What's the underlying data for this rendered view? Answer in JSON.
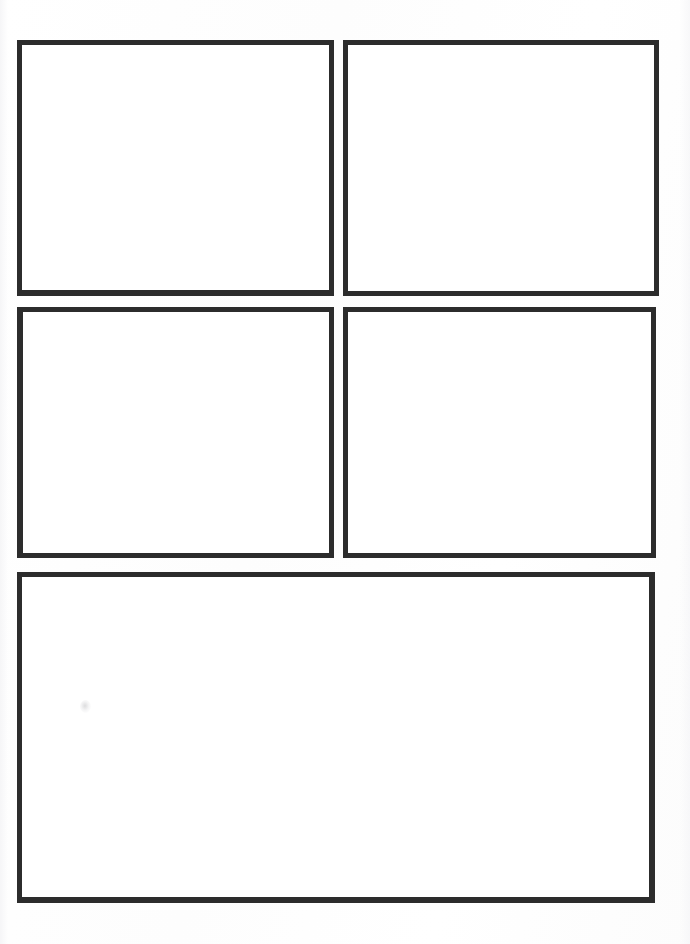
{
  "page": {
    "width": 690,
    "height": 944,
    "background_color": "#fefefe",
    "border_color": "#2c2c2c",
    "panel_fill_color": "#ffffff"
  },
  "panels": [
    {
      "id": "panel-1",
      "position": "top-left",
      "row": 1,
      "column": 1,
      "content": "",
      "x": 17,
      "y": 40,
      "width": 317,
      "height": 256
    },
    {
      "id": "panel-2",
      "position": "top-right",
      "row": 1,
      "column": 2,
      "content": "",
      "x": 343,
      "y": 40,
      "width": 316,
      "height": 256
    },
    {
      "id": "panel-3",
      "position": "middle-left",
      "row": 2,
      "column": 1,
      "content": "",
      "x": 17,
      "y": 307,
      "width": 317,
      "height": 251
    },
    {
      "id": "panel-4",
      "position": "middle-right",
      "row": 2,
      "column": 2,
      "content": "",
      "x": 343,
      "y": 307,
      "width": 313,
      "height": 251
    },
    {
      "id": "panel-5",
      "position": "bottom-full-width",
      "row": 3,
      "column": 1,
      "content": "",
      "x": 17,
      "y": 572,
      "width": 638,
      "height": 331
    }
  ],
  "artifacts": [
    {
      "id": "scan-smudge",
      "name": "faint-scan-smudge",
      "x": 80,
      "y": 700
    }
  ]
}
